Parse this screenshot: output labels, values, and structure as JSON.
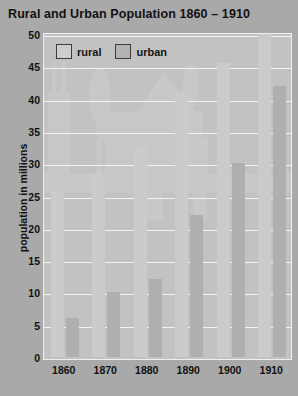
{
  "chart_data": {
    "type": "bar",
    "title": "Rural and Urban Population  1860 – 1910",
    "xlabel": "",
    "ylabel": "population in millions",
    "categories": [
      "1860",
      "1870",
      "1880",
      "1890",
      "1900",
      "1910"
    ],
    "series": [
      {
        "name": "rural",
        "color": "#cbcbcb",
        "values": [
          25.5,
          28.5,
          32.5,
          41,
          45.5,
          50
        ]
      },
      {
        "name": "urban",
        "color": "#afafaf",
        "values": [
          6,
          10,
          12,
          22,
          30,
          42
        ]
      }
    ],
    "ylim": [
      0,
      50
    ],
    "yticks": [
      0,
      5,
      10,
      15,
      20,
      25,
      30,
      35,
      40,
      45,
      50
    ],
    "grid": true,
    "legend_position": "top-left"
  },
  "legend": {
    "items": [
      {
        "label": "rural",
        "swatch": "rural-swatch"
      },
      {
        "label": "urban",
        "swatch": "urban-swatch"
      }
    ]
  },
  "colors": {
    "page_background": "#a9a9a9",
    "plot_background": "#c2c2c2",
    "gridline": "#f2f2f2",
    "baseline": "#ffffff",
    "rural_bar": "#cbcbcb",
    "urban_bar": "#afafaf",
    "text": "#111111"
  },
  "watermark": {
    "description": "farmhouse-with-barn-and-trees-illustration"
  }
}
